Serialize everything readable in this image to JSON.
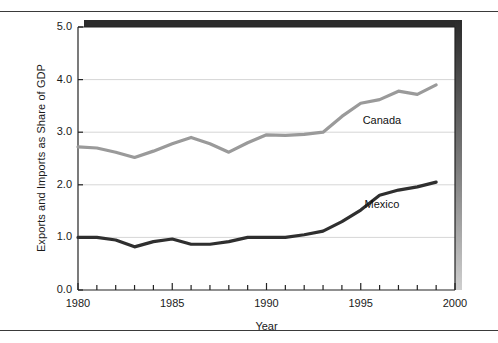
{
  "chart_data": {
    "type": "line",
    "title": "",
    "xlabel": "Year",
    "ylabel": "Exports and Imports as Share of GDP",
    "xlim": [
      1980,
      2000
    ],
    "ylim": [
      0.0,
      5.0
    ],
    "grid": "horizontal-gridlines-at-1-2-3-4",
    "legend_position": "inline-series-labels",
    "ytick_labels": [
      "0.0",
      "1.0",
      "2.0",
      "3.0",
      "4.0",
      "5.0"
    ],
    "ytick_values": [
      0.0,
      1.0,
      2.0,
      3.0,
      4.0,
      5.0
    ],
    "xtick_labels": [
      "1980",
      "1985",
      "1990",
      "1995",
      "2000"
    ],
    "xtick_values": [
      1980,
      1985,
      1990,
      1995,
      2000
    ],
    "x": [
      1980,
      1981,
      1982,
      1983,
      1984,
      1985,
      1986,
      1987,
      1988,
      1989,
      1990,
      1991,
      1992,
      1993,
      1994,
      1995,
      1996,
      1997,
      1998,
      1999
    ],
    "series": [
      {
        "name": "Canada",
        "color": "#9a9a9a",
        "label_x": 1995.1,
        "label_y": 3.22,
        "values": [
          2.72,
          2.7,
          2.62,
          2.52,
          2.64,
          2.78,
          2.9,
          2.78,
          2.62,
          2.8,
          2.95,
          2.94,
          2.96,
          3.0,
          3.3,
          3.55,
          3.62,
          3.78,
          3.72,
          3.9
        ]
      },
      {
        "name": "Mexico",
        "color": "#2f2f2f",
        "label_x": 1995.2,
        "label_y": 1.62,
        "values": [
          1.0,
          1.0,
          0.95,
          0.82,
          0.92,
          0.97,
          0.87,
          0.87,
          0.92,
          1.0,
          1.0,
          1.0,
          1.05,
          1.12,
          1.3,
          1.52,
          1.8,
          1.9,
          1.96,
          2.05
        ]
      }
    ]
  },
  "axis": {
    "xlabel": "Year",
    "ylabel": "Exports and Imports as Share of GDP"
  }
}
